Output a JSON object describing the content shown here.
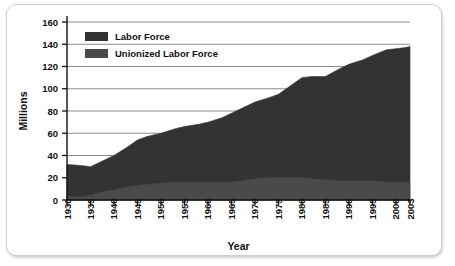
{
  "chart_data": {
    "type": "area",
    "title": "",
    "xlabel": "Year",
    "ylabel": "Millions",
    "xlim": [
      1930,
      2003
    ],
    "ylim": [
      0,
      160
    ],
    "grid": true,
    "legend_position": "top-left",
    "x_tick_labels": [
      "1930",
      "1935",
      "1940",
      "1945",
      "1950",
      "1955",
      "1960",
      "1965",
      "1970",
      "1975",
      "1980",
      "1985",
      "1990",
      "1995",
      "2000",
      "2003"
    ],
    "y_tick_labels": [
      "0",
      "20",
      "40",
      "60",
      "80",
      "100",
      "120",
      "140",
      "160"
    ],
    "x_ticks": [
      1930,
      1935,
      1940,
      1945,
      1950,
      1955,
      1960,
      1965,
      1970,
      1975,
      1980,
      1985,
      1990,
      1995,
      2000,
      2003
    ],
    "y_ticks": [
      0,
      20,
      40,
      60,
      80,
      100,
      120,
      140,
      160
    ],
    "x": [
      1930,
      1933,
      1935,
      1937,
      1940,
      1943,
      1945,
      1947,
      1950,
      1953,
      1955,
      1958,
      1960,
      1963,
      1965,
      1967,
      1970,
      1973,
      1975,
      1978,
      1980,
      1982,
      1985,
      1988,
      1990,
      1993,
      1995,
      1998,
      2000,
      2002,
      2003
    ],
    "series": [
      {
        "name": "Labor Force",
        "color": "#333333",
        "values": [
          32,
          31,
          30,
          34,
          40,
          48,
          54,
          57,
          60,
          64,
          66,
          68,
          70,
          74,
          78,
          82,
          88,
          92,
          95,
          104,
          110,
          111,
          111,
          118,
          122,
          126,
          130,
          135,
          136,
          137,
          138
        ]
      },
      {
        "name": "Unionized Labor Force",
        "color": "#4a4a4a",
        "values": [
          3,
          3,
          4,
          7,
          9,
          12,
          13,
          14,
          15,
          16,
          16,
          16,
          16,
          16,
          16,
          17,
          19,
          20,
          20,
          20,
          20,
          19,
          18,
          17,
          17,
          17,
          17,
          16,
          16,
          16,
          15
        ]
      }
    ]
  },
  "legend": {
    "items": [
      {
        "label": "Labor Force",
        "swatch_color": "#333333"
      },
      {
        "label": "Unionized Labor Force",
        "swatch_color": "#4a4a4a"
      }
    ]
  }
}
